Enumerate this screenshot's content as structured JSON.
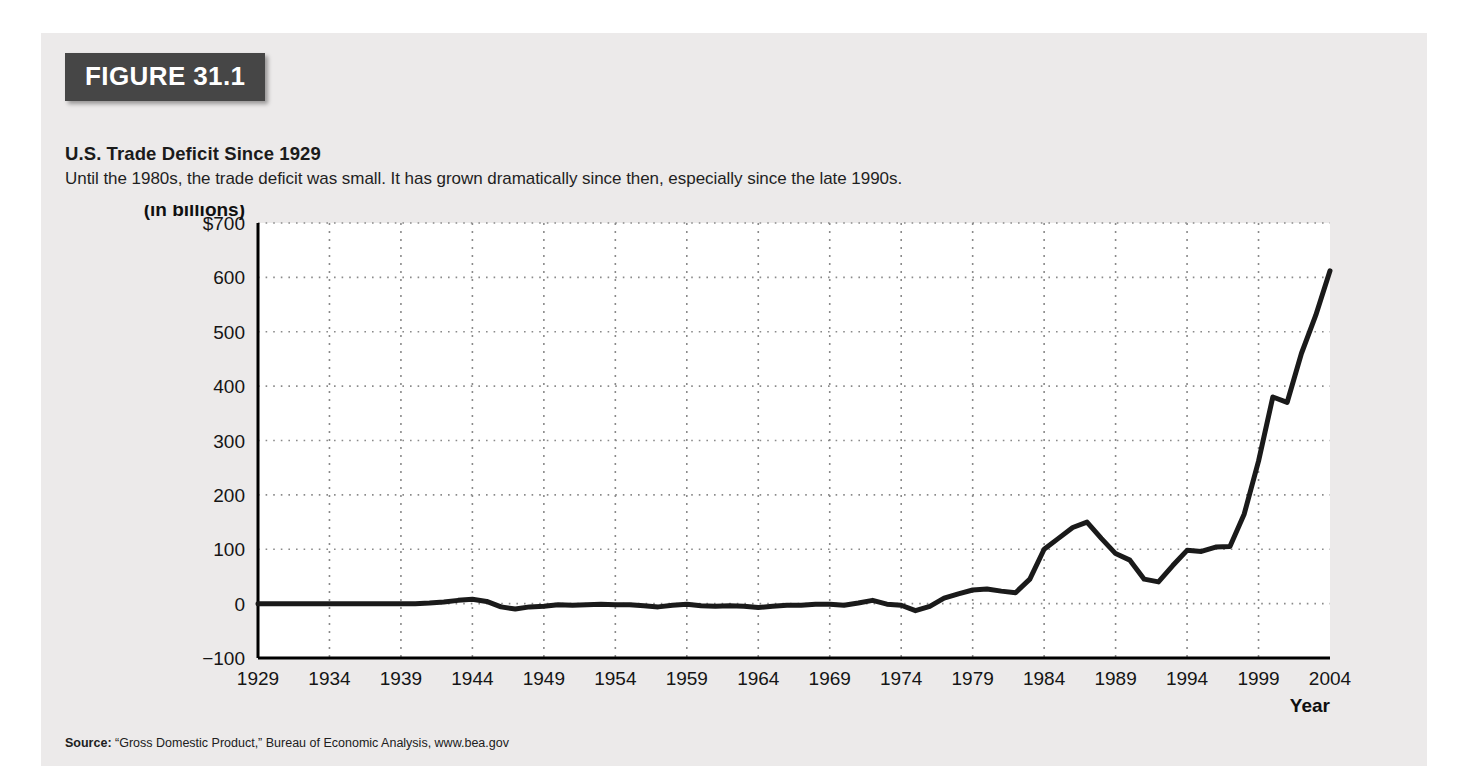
{
  "figure": {
    "badge": "FIGURE 31.1",
    "title": "U.S. Trade Deficit Since 1929",
    "subtitle": "Until the 1980s, the trade deficit was small. It has grown dramatically since then, especially since the late 1990s.",
    "source_prefix": "Source:",
    "source_text": "“Gross Domestic Product,” Bureau of Economic Analysis, www.bea.gov"
  },
  "colors": {
    "badge_background": "#464646",
    "card_background": "#eceaea",
    "plot_background": "#ffffff",
    "line": "#1a1a1a",
    "grid": "#8a8a8a",
    "axis": "#000000"
  },
  "chart_data": {
    "type": "line",
    "title": "U.S. Trade Deficit Since 1929",
    "xlabel": "Year",
    "ylabel": "Trade deficit (in billions)",
    "ylabel_line1": "Trade deficit",
    "ylabel_line2": "(in billions)",
    "xlim": [
      1929,
      2004
    ],
    "ylim": [
      -100,
      700
    ],
    "grid": true,
    "legend": "none",
    "ytick_labels": [
      "$700",
      "600",
      "500",
      "400",
      "300",
      "200",
      "100",
      "0",
      "−100"
    ],
    "ytick_values": [
      700,
      600,
      500,
      400,
      300,
      200,
      100,
      0,
      -100
    ],
    "xtick_labels": [
      "1929",
      "1934",
      "1939",
      "1944",
      "1949",
      "1954",
      "1959",
      "1964",
      "1969",
      "1974",
      "1979",
      "1984",
      "1989",
      "1994",
      "1999",
      "2004"
    ],
    "xtick_values": [
      1929,
      1934,
      1939,
      1944,
      1949,
      1954,
      1959,
      1964,
      1969,
      1974,
      1979,
      1984,
      1989,
      1994,
      1999,
      2004
    ],
    "x": [
      1929,
      1930,
      1931,
      1932,
      1933,
      1934,
      1935,
      1936,
      1937,
      1938,
      1939,
      1940,
      1941,
      1942,
      1943,
      1944,
      1945,
      1946,
      1947,
      1948,
      1949,
      1950,
      1951,
      1952,
      1953,
      1954,
      1955,
      1956,
      1957,
      1958,
      1959,
      1960,
      1961,
      1962,
      1963,
      1964,
      1965,
      1966,
      1967,
      1968,
      1969,
      1970,
      1971,
      1972,
      1973,
      1974,
      1975,
      1976,
      1977,
      1978,
      1979,
      1980,
      1981,
      1982,
      1983,
      1984,
      1985,
      1986,
      1987,
      1988,
      1989,
      1990,
      1991,
      1992,
      1993,
      1994,
      1995,
      1996,
      1997,
      1998,
      1999,
      2000,
      2001,
      2002,
      2003,
      2004
    ],
    "values": [
      0,
      0,
      0,
      0,
      0,
      0,
      0,
      0,
      0,
      0,
      0,
      0,
      1,
      3,
      6,
      8,
      4,
      -6,
      -10,
      -6,
      -5,
      -2,
      -3,
      -2,
      -1,
      -2,
      -2,
      -4,
      -6,
      -3,
      -1,
      -4,
      -5,
      -4,
      -5,
      -7,
      -5,
      -3,
      -3,
      -1,
      -1,
      -3,
      1,
      6,
      -1,
      -3,
      -13,
      -5,
      10,
      18,
      25,
      27,
      23,
      20,
      45,
      100,
      120,
      140,
      150,
      120,
      92,
      80,
      45,
      40,
      70,
      98,
      96,
      104,
      105,
      165,
      262,
      380,
      370,
      460,
      530,
      612
    ],
    "series_name": "U.S. trade deficit (billions of dollars)"
  }
}
